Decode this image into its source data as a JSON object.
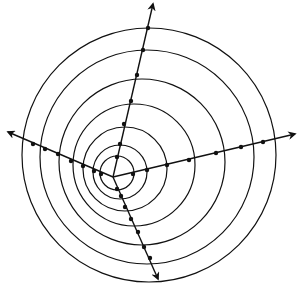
{
  "diagram": {
    "title": "",
    "type": "arc-spiral-with-rays",
    "stroke_color": "#111111",
    "background": "#ffffff",
    "center": [
      113,
      177
    ],
    "rays": [
      {
        "name": "ray-up",
        "end": [
          153,
          4
        ],
        "dots": [
          [
            148,
            28
          ],
          [
            143,
            50
          ],
          [
            137,
            75
          ],
          [
            131,
            101
          ],
          [
            124,
            124
          ],
          [
            120,
            144
          ],
          [
            117,
            157
          ]
        ]
      },
      {
        "name": "ray-right",
        "end": [
          295,
          134
        ],
        "dots": [
          [
            133,
            174
          ],
          [
            147,
            170
          ],
          [
            167,
            165
          ],
          [
            189,
            160
          ],
          [
            216,
            153
          ],
          [
            241,
            147
          ],
          [
            263,
            142
          ]
        ]
      },
      {
        "name": "ray-left",
        "end": [
          8,
          132
        ],
        "dots": [
          [
            33,
            144
          ],
          [
            45,
            149
          ],
          [
            58,
            154
          ],
          [
            71,
            161
          ],
          [
            83,
            166
          ],
          [
            94,
            171
          ],
          [
            101,
            174
          ]
        ]
      },
      {
        "name": "ray-down",
        "end": [
          158,
          279
        ],
        "dots": [
          [
            117,
            189
          ],
          [
            121,
            196
          ],
          [
            125,
            207
          ],
          [
            131,
            219
          ],
          [
            138,
            232
          ],
          [
            144,
            247
          ],
          [
            150,
            258
          ]
        ]
      }
    ],
    "circles": [
      {
        "cx": 117,
        "cy": 173,
        "r": 17
      },
      {
        "cx": 120,
        "cy": 172,
        "r": 27
      },
      {
        "cx": 125,
        "cy": 169,
        "r": 42
      },
      {
        "cx": 134,
        "cy": 165,
        "r": 61
      },
      {
        "cx": 142,
        "cy": 162,
        "r": 83
      },
      {
        "cx": 147,
        "cy": 157,
        "r": 107
      },
      {
        "cx": 149,
        "cy": 155,
        "r": 127
      }
    ]
  }
}
